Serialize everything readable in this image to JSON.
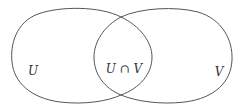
{
  "diagram": {
    "type": "venn",
    "sets": [
      {
        "id": "U",
        "label": "U"
      },
      {
        "id": "V",
        "label": "V"
      }
    ],
    "intersection": {
      "label": "U ∩ V"
    },
    "labels": {
      "left": "U",
      "center": "U ∩ V",
      "right": "V"
    },
    "colors": {
      "stroke": "#555555",
      "text": "#333333",
      "background": "#ffffff"
    }
  }
}
